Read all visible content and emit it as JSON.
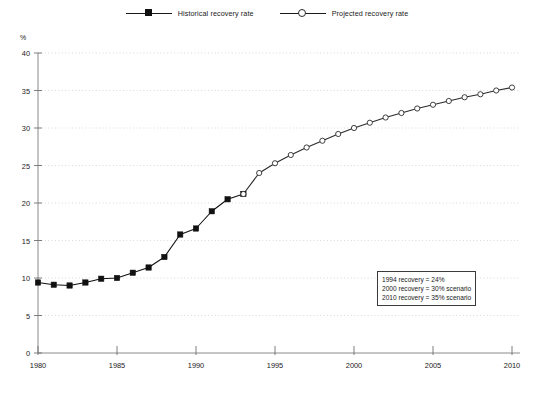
{
  "legend": {
    "position": "top-center",
    "entries": [
      {
        "label": "Historical recovery rate",
        "marker": "filled-square-marker",
        "color": "#111111"
      },
      {
        "label": "Projected recovery rate",
        "marker": "open-circle-marker",
        "color": "#2b2b2b"
      }
    ]
  },
  "axes": {
    "y_unit_label": "%",
    "y_ticks": [
      "0",
      "5",
      "10",
      "15",
      "20",
      "25",
      "30",
      "35",
      "40"
    ],
    "x_ticks": [
      "1980",
      "1985",
      "1990",
      "1995",
      "2000",
      "2005",
      "2010"
    ]
  },
  "annotation": {
    "lines": [
      "1994 recovery = 24%",
      "2000 recovery = 30% scenario",
      "2010 recovery = 35% scenario"
    ]
  },
  "chart_data": {
    "type": "line",
    "title": "",
    "subtitle": "",
    "xlabel": "",
    "ylabel": "%",
    "xlim": [
      1980,
      2010
    ],
    "ylim": [
      0,
      40
    ],
    "ytick_interval": 5,
    "xtick_interval": 5,
    "grid": "horizontal-dotted",
    "legend_position": "top-center",
    "series": [
      {
        "name": "Historical recovery rate",
        "marker": "filled-square",
        "color": "#111111",
        "x": [
          1980,
          1981,
          1982,
          1983,
          1984,
          1985,
          1986,
          1987,
          1988,
          1989,
          1990,
          1991,
          1992,
          1993
        ],
        "values": [
          9.4,
          9.1,
          9.0,
          9.4,
          9.9,
          10.0,
          10.7,
          11.4,
          12.8,
          15.8,
          16.6,
          18.9,
          20.5,
          21.2
        ]
      },
      {
        "name": "Projected recovery rate",
        "marker": "open-circle",
        "color": "#2b2b2b",
        "x": [
          1993,
          1994,
          1995,
          1996,
          1997,
          1998,
          1999,
          2000,
          2001,
          2002,
          2003,
          2004,
          2005,
          2006,
          2007,
          2008,
          2009,
          2010
        ],
        "values": [
          21.2,
          24.0,
          25.3,
          26.4,
          27.4,
          28.3,
          29.2,
          30.0,
          30.7,
          31.4,
          32.0,
          32.6,
          33.1,
          33.6,
          34.1,
          34.5,
          35.0,
          35.4
        ]
      }
    ],
    "annotations": [
      "1994 recovery = 24%",
      "2000 recovery = 30% scenario",
      "2010 recovery = 35% scenario"
    ]
  }
}
